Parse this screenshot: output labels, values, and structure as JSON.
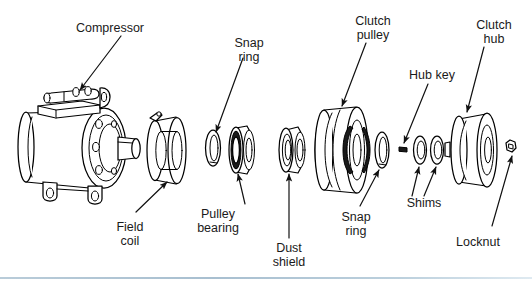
{
  "figure": {
    "background_color": "#ffffff",
    "line_color": "#000000",
    "label_color": "#1a1a1a",
    "divider_color": "#b0c6d6"
  },
  "labels": {
    "compressor": "Compressor",
    "snap_ring_top": {
      "line1": "Snap",
      "line2": "ring"
    },
    "clutch_pulley": {
      "line1": "Clutch",
      "line2": "pulley"
    },
    "hub_key": "Hub key",
    "clutch_hub": {
      "line1": "Clutch",
      "line2": "hub"
    },
    "field_coil": {
      "line1": "Field",
      "line2": "coil"
    },
    "pulley_bearing": {
      "line1": "Pulley",
      "line2": "bearing"
    },
    "dust_shield": {
      "line1": "Dust",
      "line2": "shield"
    },
    "snap_ring_bottom": {
      "line1": "Snap",
      "line2": "ring"
    },
    "shims": "Shims",
    "locknut": "Locknut"
  },
  "parts_sequence": [
    "Compressor",
    "Field coil",
    "Snap ring",
    "Pulley bearing",
    "Dust shield",
    "Clutch pulley",
    "Snap ring",
    "Hub key",
    "Shims",
    "Clutch hub",
    "Locknut"
  ]
}
